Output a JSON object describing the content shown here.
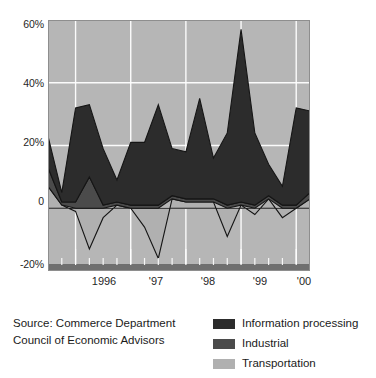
{
  "chart_data": {
    "type": "area",
    "stacked": true,
    "title": "",
    "xlabel": "",
    "ylabel": "",
    "ylim": [
      -20,
      60
    ],
    "ytick_labels": [
      "60%",
      "40%",
      "20%",
      "0",
      "-20%"
    ],
    "ytick_values": [
      60,
      40,
      20,
      0,
      -20
    ],
    "grid": true,
    "plot_background": "#b6b6b6",
    "gridline_color": "#ffffff",
    "x_tick_labels": [
      "1996",
      "'97",
      "'98",
      "'99",
      "'00"
    ],
    "x_tick_positions": [
      1996,
      1997,
      1998,
      1999,
      2000
    ],
    "x": [
      "1995Q3",
      "1995Q4",
      "1996Q1",
      "1996Q2",
      "1996Q3",
      "1996Q4",
      "1997Q1",
      "1997Q2",
      "1997Q3",
      "1997Q4",
      "1998Q1",
      "1998Q2",
      "1998Q3",
      "1998Q4",
      "1999Q1",
      "1999Q2",
      "1999Q3",
      "1999Q4",
      "2000Q1",
      "2000Q2"
    ],
    "series": [
      {
        "name": "Transportation",
        "color": "#b0b0b0",
        "values": [
          7,
          1,
          -1,
          -13,
          -3,
          1,
          0,
          -6,
          -16,
          3,
          2,
          2,
          2,
          -9,
          1,
          -2,
          3,
          -3,
          0,
          3
        ]
      },
      {
        "name": "Industrial",
        "color": "#4b4b4b",
        "values": [
          6,
          1,
          2,
          10,
          1,
          1,
          1,
          1,
          1,
          1,
          1,
          1,
          1,
          1,
          1,
          1,
          1,
          1,
          1,
          2
        ]
      },
      {
        "name": "Information processing",
        "color": "#2c2c2c",
        "values": [
          10,
          3,
          30,
          23,
          18,
          7,
          20,
          20,
          32,
          15,
          15,
          32,
          13,
          23,
          55,
          23,
          10,
          6,
          31,
          26
        ]
      }
    ],
    "legend_position": "bottom-right",
    "legend_entries": [
      {
        "label": "Information processing",
        "color": "#2c2c2c"
      },
      {
        "label": "Industrial",
        "color": "#4b4b4b"
      },
      {
        "label": "Transportation",
        "color": "#b0b0b0"
      }
    ]
  },
  "source": {
    "line1": "Source: Commerce Department",
    "line2": "Council of Economic Advisors"
  }
}
